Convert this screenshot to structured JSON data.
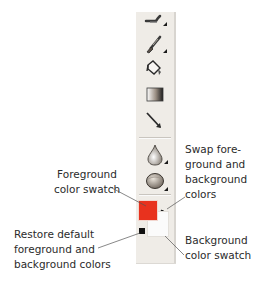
{
  "toolbar": {
    "tools": [
      {
        "name": "smudge-tool",
        "icon": "smudge-icon",
        "has_submenu": true
      },
      {
        "name": "brush-tool",
        "icon": "paintbrush-icon",
        "has_submenu": true
      },
      {
        "name": "paint-bucket-tool",
        "icon": "paint-bucket-icon",
        "has_submenu": false
      },
      {
        "name": "gradient-tool",
        "icon": "gradient-icon",
        "has_submenu": false
      },
      {
        "name": "line-tool",
        "icon": "line-arrow-icon",
        "has_submenu": false
      },
      {
        "name": "blur-tool",
        "icon": "water-drop-icon",
        "has_submenu": true
      },
      {
        "name": "sponge-tool",
        "icon": "sponge-icon",
        "has_submenu": true
      }
    ],
    "colors": {
      "foreground": "#e8321e",
      "background": "#fbfbfb",
      "panel": "#efece7"
    }
  },
  "callouts": {
    "foreground": {
      "line1": "Foreground",
      "line2": "color swatch"
    },
    "restore": {
      "line1": "Restore default",
      "line2": "foreground and",
      "line3": "background colors"
    },
    "swap": {
      "line1": "Swap fore-",
      "line2": "ground and",
      "line3": "background",
      "line4": "colors"
    },
    "background": {
      "line1": "Background",
      "line2": "color swatch"
    }
  }
}
